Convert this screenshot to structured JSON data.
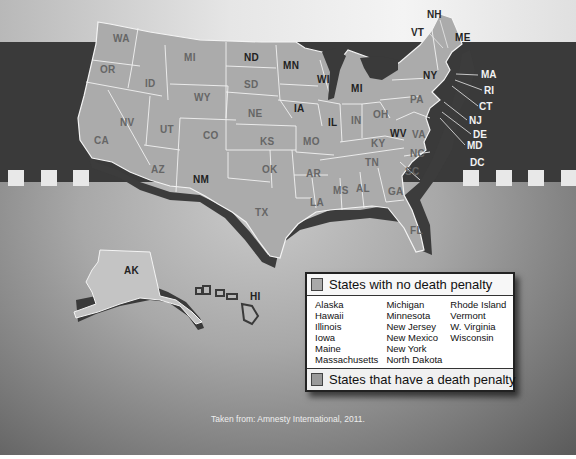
{
  "map": {
    "title": "US states and the death penalty",
    "state_labels": [
      {
        "abbr": "WA",
        "x": 113,
        "y": 38,
        "no_death_penalty": false
      },
      {
        "abbr": "OR",
        "x": 100,
        "y": 68,
        "no_death_penalty": false
      },
      {
        "abbr": "ID",
        "x": 145,
        "y": 78,
        "no_death_penalty": false
      },
      {
        "abbr": "MI",
        "x": 184,
        "y": 54,
        "no_death_penalty": false
      },
      {
        "abbr": "WY",
        "x": 194,
        "y": 94,
        "no_death_penalty": false
      },
      {
        "abbr": "NV",
        "x": 120,
        "y": 118,
        "no_death_penalty": false
      },
      {
        "abbr": "UT",
        "x": 160,
        "y": 125,
        "no_death_penalty": false
      },
      {
        "abbr": "CO",
        "x": 203,
        "y": 131,
        "no_death_penalty": false
      },
      {
        "abbr": "CA",
        "x": 94,
        "y": 135,
        "no_death_penalty": false
      },
      {
        "abbr": "AZ",
        "x": 151,
        "y": 165,
        "no_death_penalty": false
      },
      {
        "abbr": "NM",
        "x": 193,
        "y": 175,
        "no_death_penalty": true
      },
      {
        "abbr": "ND",
        "x": 244,
        "y": 53,
        "no_death_penalty": true
      },
      {
        "abbr": "SD",
        "x": 244,
        "y": 79,
        "no_death_penalty": false
      },
      {
        "abbr": "NE",
        "x": 248,
        "y": 108,
        "no_death_penalty": false
      },
      {
        "abbr": "KS",
        "x": 260,
        "y": 136,
        "no_death_penalty": false
      },
      {
        "abbr": "OK",
        "x": 262,
        "y": 165,
        "no_death_penalty": false
      },
      {
        "abbr": "TX",
        "x": 255,
        "y": 207,
        "no_death_penalty": false
      },
      {
        "abbr": "MN",
        "x": 283,
        "y": 61,
        "no_death_penalty": true
      },
      {
        "abbr": "IA",
        "x": 294,
        "y": 103,
        "no_death_penalty": true
      },
      {
        "abbr": "MO",
        "x": 303,
        "y": 136,
        "no_death_penalty": false
      },
      {
        "abbr": "AR",
        "x": 306,
        "y": 168,
        "no_death_penalty": false
      },
      {
        "abbr": "LA",
        "x": 310,
        "y": 197,
        "no_death_penalty": false
      },
      {
        "abbr": "WI",
        "x": 317,
        "y": 75,
        "no_death_penalty": true
      },
      {
        "abbr": "IL",
        "x": 328,
        "y": 117,
        "no_death_penalty": true
      },
      {
        "abbr": "MI",
        "x": 351,
        "y": 83,
        "no_death_penalty": true
      },
      {
        "abbr": "IN",
        "x": 351,
        "y": 115,
        "no_death_penalty": false
      },
      {
        "abbr": "MS",
        "x": 333,
        "y": 185,
        "no_death_penalty": false
      },
      {
        "abbr": "AL",
        "x": 356,
        "y": 183,
        "no_death_penalty": false
      },
      {
        "abbr": "TN",
        "x": 365,
        "y": 157,
        "no_death_penalty": false
      },
      {
        "abbr": "KY",
        "x": 371,
        "y": 138,
        "no_death_penalty": false
      },
      {
        "abbr": "OH",
        "x": 373,
        "y": 109,
        "no_death_penalty": false
      },
      {
        "abbr": "GA",
        "x": 388,
        "y": 186,
        "no_death_penalty": false
      },
      {
        "abbr": "FL",
        "x": 410,
        "y": 225,
        "no_death_penalty": false
      },
      {
        "abbr": "WV",
        "x": 392,
        "y": 128,
        "no_death_penalty": true
      },
      {
        "abbr": "VA",
        "x": 412,
        "y": 129,
        "no_death_penalty": false
      },
      {
        "abbr": "NC",
        "x": 410,
        "y": 148,
        "no_death_penalty": false
      },
      {
        "abbr": "SC",
        "x": 405,
        "y": 167,
        "no_death_penalty": false
      },
      {
        "abbr": "PA",
        "x": 410,
        "y": 95,
        "no_death_penalty": false
      },
      {
        "abbr": "NY",
        "x": 423,
        "y": 71,
        "no_death_penalty": true
      },
      {
        "abbr": "ME",
        "x": 455,
        "y": 36,
        "no_death_penalty": true
      }
    ],
    "callout_labels": [
      {
        "abbr": "NH",
        "x": 427,
        "y": 10,
        "style": "dark"
      },
      {
        "abbr": "VT",
        "x": 411,
        "y": 28,
        "style": "dark"
      },
      {
        "abbr": "MA",
        "x": 481,
        "y": 71,
        "style": "light"
      },
      {
        "abbr": "RI",
        "x": 484,
        "y": 86,
        "style": "light"
      },
      {
        "abbr": "CT",
        "x": 479,
        "y": 102,
        "style": "light"
      },
      {
        "abbr": "NJ",
        "x": 469,
        "y": 116,
        "style": "light"
      },
      {
        "abbr": "DE",
        "x": 473,
        "y": 130,
        "style": "light"
      },
      {
        "abbr": "MD",
        "x": 467,
        "y": 141,
        "style": "light"
      },
      {
        "abbr": "DC",
        "x": 470,
        "y": 158,
        "style": "light"
      }
    ],
    "inset_labels": [
      {
        "abbr": "AK",
        "x": 122,
        "y": 266
      },
      {
        "abbr": "HI",
        "x": 250,
        "y": 291
      }
    ]
  },
  "legend": {
    "no_death_penalty_title": "States with no death penalty",
    "no_death_penalty_states": [
      [
        "Alaska",
        "Hawaii",
        "Illinois",
        "Iowa",
        "Maine",
        "Massachusetts"
      ],
      [
        "Michigan",
        "Minnesota",
        "New Jersey",
        "New Mexico",
        "New York",
        "North Dakota"
      ],
      [
        "Rhode Island",
        "Vermont",
        "W. Virginia",
        "Wisconsin"
      ]
    ],
    "death_penalty_title": "States that have a death penalty"
  },
  "source": "Taken from: Amnesty International, 2011.",
  "colors": {
    "state_fill": "#aaaaaa",
    "state_border": "#f2f2f2",
    "extrusion": "#3c3c3c",
    "dark_band": "#3a3a3a"
  }
}
